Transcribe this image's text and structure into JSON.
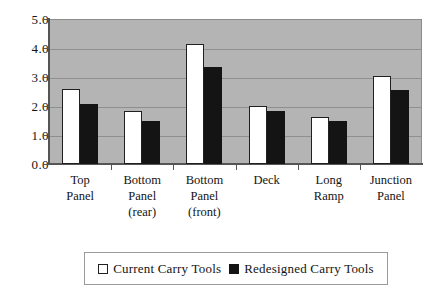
{
  "chart_data": {
    "type": "bar",
    "title": "",
    "subtitle": "",
    "xlabel": "",
    "ylabel": "",
    "ylim": [
      0,
      5
    ],
    "ytick_step": 1,
    "ytick_labels": [
      "0.0",
      "1.0",
      "2.0",
      "3.0",
      "4.0",
      "5.0"
    ],
    "grid": true,
    "legend_position": "bottom",
    "categories": [
      "Top Panel",
      "Bottom Panel (rear)",
      "Bottom Panel (front)",
      "Deck",
      "Long Ramp",
      "Junction Panel"
    ],
    "category_lines": [
      [
        "Top",
        "Panel"
      ],
      [
        "Bottom",
        "Panel",
        "(rear)"
      ],
      [
        "Bottom",
        "Panel",
        "(front)"
      ],
      [
        "Deck"
      ],
      [
        "Long",
        "Ramp"
      ],
      [
        "Junction",
        "Panel"
      ]
    ],
    "series": [
      {
        "name": "Current Carry Tools",
        "color": "#ffffff",
        "values": [
          2.6,
          1.82,
          4.14,
          2.0,
          1.62,
          3.05
        ]
      },
      {
        "name": "Redesigned Carry Tools",
        "color": "#141414",
        "values": [
          2.07,
          1.5,
          3.35,
          1.82,
          1.5,
          2.55
        ]
      }
    ]
  },
  "legend": {
    "entries": [
      {
        "label": "Current Carry Tools",
        "swatch": "white-square-icon"
      },
      {
        "label": "Redesigned Carry Tools",
        "swatch": "black-square-icon"
      }
    ]
  },
  "colors": {
    "plot_background": "#b4b4b4",
    "gridline": "#8f8f8f",
    "axis": "#555555",
    "text": "#141414",
    "page_background": "#ffffff"
  }
}
